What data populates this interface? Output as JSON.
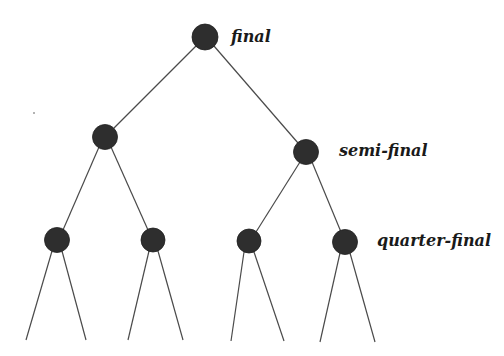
{
  "diagram": {
    "type": "tournament-bracket-tree",
    "colors": {
      "background": "#ffffff",
      "node": "#2e2e2e",
      "edge": "#4a4a4a",
      "label": "#1a1a1a"
    },
    "labels": {
      "final": "final",
      "semi_final": "semi-final",
      "quarter_final": "quarter-final"
    },
    "levels": [
      {
        "name": "final",
        "nodes": [
          {
            "id": "F",
            "cx": 205,
            "cy": 37,
            "r": 13
          }
        ]
      },
      {
        "name": "semi-final",
        "nodes": [
          {
            "id": "SF1",
            "cx": 105,
            "cy": 137,
            "r": 12
          },
          {
            "id": "SF2",
            "cx": 306,
            "cy": 152,
            "r": 12
          }
        ]
      },
      {
        "name": "quarter-final",
        "nodes": [
          {
            "id": "QF1",
            "cx": 57,
            "cy": 240,
            "r": 12
          },
          {
            "id": "QF2",
            "cx": 153,
            "cy": 240,
            "r": 12
          },
          {
            "id": "QF3",
            "cx": 249,
            "cy": 241,
            "r": 12
          },
          {
            "id": "QF4",
            "cx": 345,
            "cy": 242,
            "r": 12
          }
        ]
      }
    ],
    "edges": [
      {
        "from": "F",
        "to": "SF1"
      },
      {
        "from": "F",
        "to": "SF2"
      },
      {
        "from": "SF1",
        "to": "QF1"
      },
      {
        "from": "SF1",
        "to": "QF2"
      },
      {
        "from": "SF2",
        "to": "QF3"
      },
      {
        "from": "SF2",
        "to": "QF4"
      }
    ],
    "open_branches": [
      {
        "from": "QF1",
        "to_x": 26,
        "to_y": 340
      },
      {
        "from": "QF1",
        "to_x": 86,
        "to_y": 340
      },
      {
        "from": "QF2",
        "to_x": 128,
        "to_y": 340
      },
      {
        "from": "QF2",
        "to_x": 183,
        "to_y": 340
      },
      {
        "from": "QF3",
        "to_x": 231,
        "to_y": 341
      },
      {
        "from": "QF3",
        "to_x": 284,
        "to_y": 341
      },
      {
        "from": "QF4",
        "to_x": 320,
        "to_y": 342
      },
      {
        "from": "QF4",
        "to_x": 375,
        "to_y": 342
      }
    ]
  }
}
